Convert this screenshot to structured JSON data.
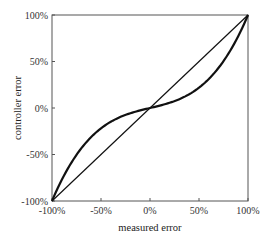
{
  "chart_data": {
    "type": "line",
    "title": "",
    "xlabel": "measured error",
    "ylabel": "controller error",
    "xlim": [
      -100,
      100
    ],
    "ylim": [
      -100,
      100
    ],
    "x_ticks": [
      "-100%",
      "-50%",
      "0%",
      "50%",
      "100%"
    ],
    "y_ticks": [
      "-100%",
      "-50%",
      "0%",
      "50%",
      "100%"
    ],
    "grid": false,
    "legend": null,
    "series": [
      {
        "name": "identity (linear)",
        "x": [
          -100,
          100
        ],
        "y": [
          -100,
          100
        ],
        "line_width": "thin"
      },
      {
        "name": "nonlinear (cubic-like) response",
        "x": [
          -100,
          -75,
          -50,
          -25,
          0,
          25,
          50,
          75,
          100
        ],
        "y": [
          -100,
          -50,
          -22,
          -7,
          0,
          7,
          22,
          50,
          100
        ],
        "line_width": "thick"
      }
    ]
  },
  "plot": {
    "left": 52,
    "top": 15,
    "right": 248,
    "bottom": 201,
    "line_color": "#111111",
    "frame_color": "#555555"
  }
}
